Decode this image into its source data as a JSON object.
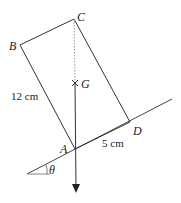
{
  "diagram": {
    "type": "physics-diagram",
    "points": {
      "A": {
        "label": "A"
      },
      "B": {
        "label": "B"
      },
      "C": {
        "label": "C"
      },
      "D": {
        "label": "D"
      },
      "G": {
        "label": "G"
      }
    },
    "dimensions": {
      "AB": "12 cm",
      "AD": "5 cm"
    },
    "angle": {
      "label": "θ"
    },
    "colors": {
      "line": "#333333",
      "dashed": "#999999"
    }
  }
}
